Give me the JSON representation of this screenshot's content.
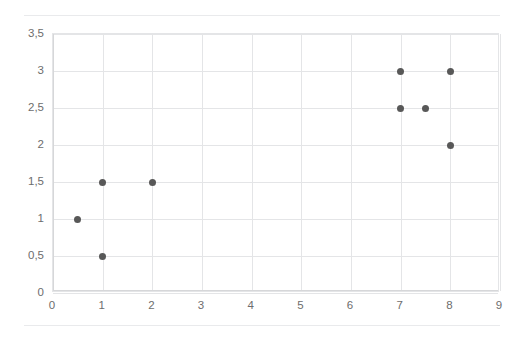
{
  "chart_data": {
    "type": "scatter",
    "title": "",
    "xlabel": "",
    "ylabel": "",
    "xlim": [
      0,
      9
    ],
    "ylim": [
      0,
      3.5
    ],
    "grid": true,
    "legend": null,
    "legend_position": "none",
    "marker_color": "#585858",
    "gridline_color": "#e4e5e7",
    "tick_label_color": "#6d6d6d",
    "background_color": "#ffffff",
    "decimal_separator": ",",
    "x_ticks": [
      0,
      1,
      2,
      3,
      4,
      5,
      6,
      7,
      8,
      9
    ],
    "x_tick_labels": [
      "0",
      "1",
      "2",
      "3",
      "4",
      "5",
      "6",
      "7",
      "8",
      "9"
    ],
    "y_ticks": [
      0,
      0.5,
      1,
      1.5,
      2,
      2.5,
      3,
      3.5
    ],
    "y_tick_labels": [
      "0",
      "0,5",
      "1",
      "1,5",
      "2",
      "2,5",
      "3",
      "3,5"
    ],
    "points": [
      {
        "x": 0.5,
        "y": 1
      },
      {
        "x": 1,
        "y": 0.5
      },
      {
        "x": 1,
        "y": 1.5
      },
      {
        "x": 2,
        "y": 1.5
      },
      {
        "x": 7,
        "y": 2.5
      },
      {
        "x": 7,
        "y": 3
      },
      {
        "x": 7.5,
        "y": 2.5
      },
      {
        "x": 8,
        "y": 2
      },
      {
        "x": 8,
        "y": 3
      }
    ],
    "series": [
      {
        "name": "",
        "x": [
          0.5,
          1,
          1,
          2,
          7,
          7,
          7.5,
          8,
          8
        ],
        "values": [
          1,
          0.5,
          1.5,
          1.5,
          2.5,
          3,
          2.5,
          2,
          3
        ]
      }
    ]
  }
}
